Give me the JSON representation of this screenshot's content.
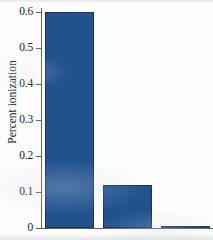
{
  "chart_data": {
    "type": "bar",
    "title": "",
    "xlabel": "",
    "ylabel": "Percent ionization",
    "categories": [
      "",
      "",
      ""
    ],
    "values": [
      0.6,
      0.12,
      0.006
    ],
    "ylim": [
      0,
      0.6
    ],
    "yticks": [
      0,
      0.1,
      0.2,
      0.3,
      0.4,
      0.5,
      0.6
    ],
    "ytick_labels": [
      "0",
      "0.1",
      "0.2",
      "0.3",
      "0.4",
      "0.5",
      "0.6"
    ],
    "xticks": [],
    "xtick_labels": [],
    "grid": false,
    "legend": false,
    "bar_color": "#21528E",
    "bar_edge_color": "#16325D",
    "background_color": "#FDFDFB",
    "axis_color": "#5C6166"
  }
}
